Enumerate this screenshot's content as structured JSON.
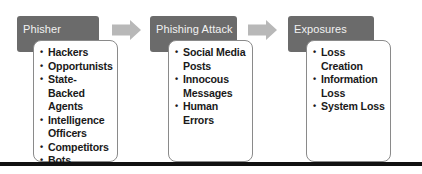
{
  "diagram": {
    "colors": {
      "header_fill": "#6b6b6b",
      "header_text": "#f2f2f2",
      "card_border": "#8a8a8a",
      "arrow_fill": "#b8b8b8",
      "rule": "#111111"
    },
    "stages": [
      {
        "title": "Phisher",
        "items": [
          "Hackers",
          "Opportunists",
          "State-Backed Agents",
          "Intelligence Officers",
          "Competitors",
          "Bots"
        ]
      },
      {
        "title": "Phishing Attack",
        "items": [
          "Social Media Posts",
          "Innocous Messages",
          "Human Errors"
        ]
      },
      {
        "title": "Exposures",
        "items": [
          "Loss Creation",
          "Information Loss",
          "System Loss"
        ]
      }
    ],
    "bullet_glyph": "•",
    "connector_icon": "right-arrow-icon"
  }
}
